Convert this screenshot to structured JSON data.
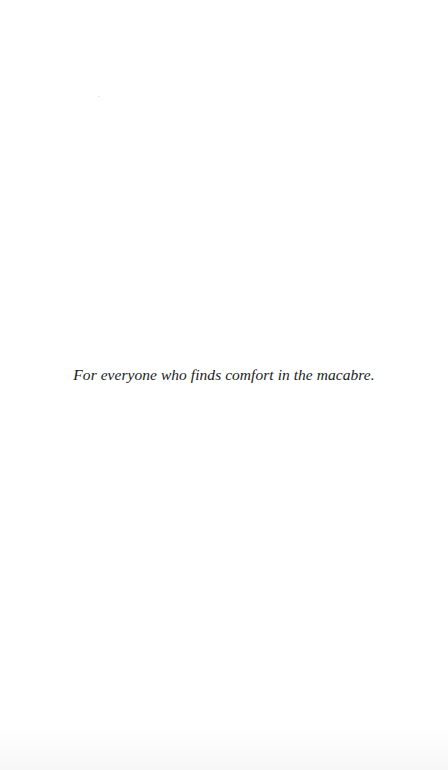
{
  "page": {
    "background": "#ffffff",
    "text_color": "#1a1a1a",
    "dedication": "For everyone who finds comfort in the macabre."
  }
}
